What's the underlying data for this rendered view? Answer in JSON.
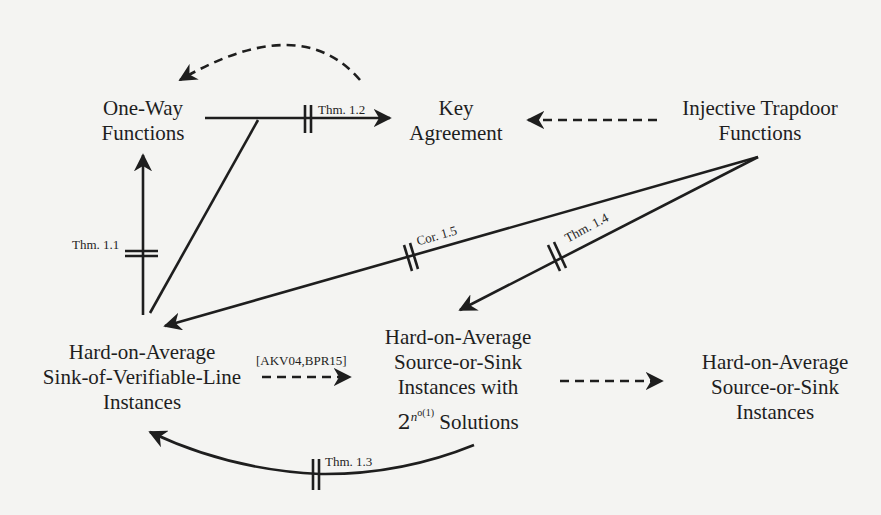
{
  "nodes": {
    "owf": {
      "line1": "One-Way",
      "line2": "Functions"
    },
    "ka": {
      "line1": "Key",
      "line2": "Agreement"
    },
    "itf": {
      "line1": "Injective Trapdoor",
      "line2": "Functions"
    },
    "sovl": {
      "line1": "Hard-on-Average",
      "line2": "Sink-of-Verifiable-Line",
      "line3": "Instances"
    },
    "sos_sub": {
      "line1": "Hard-on-Average",
      "line2": "Source-or-Sink",
      "line3": "Instances with",
      "base": "2",
      "exp": "n",
      "exp2": "o(1)",
      "tail": " Solutions"
    },
    "sos": {
      "line1": "Hard-on-Average",
      "line2": "Source-or-Sink",
      "line3": "Instances"
    }
  },
  "edges": {
    "thm12": "Thm. 1.2",
    "thm11": "Thm. 1.1",
    "cor15": "Cor. 1.5",
    "thm14": "Thm. 1.4",
    "thm13": "Thm. 1.3",
    "akv": "[AKV04,BPR15]"
  }
}
